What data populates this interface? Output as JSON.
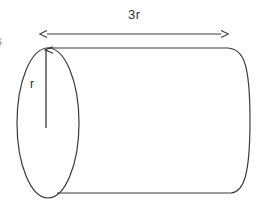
{
  "figure": {
    "kind": "geometry-diagram",
    "shape": "cylinder",
    "background_color": "#ffffff",
    "stroke_color": "#3a3a3a",
    "text_color": "#2f2f2f",
    "labels": {
      "length": "3r",
      "radius": "r",
      "clipped_left_edge": "s"
    },
    "annotations": {
      "length_dimension": "double-headed-arrow",
      "radius_dimension": "single-headed-arrow"
    },
    "geometry": {
      "left_ellipse_center_x": 48,
      "left_ellipse_center_y": 123,
      "left_ellipse_rx": 31,
      "left_ellipse_ry": 75,
      "body_top_y": 48,
      "body_bottom_y": 193,
      "body_right_x": 250,
      "dimension_arrow_y": 34,
      "dimension_arrow_x1": 45,
      "dimension_arrow_x2": 223,
      "radius_arrow_x": 46,
      "radius_arrow_y_bottom": 128,
      "radius_arrow_y_top": 48
    }
  }
}
